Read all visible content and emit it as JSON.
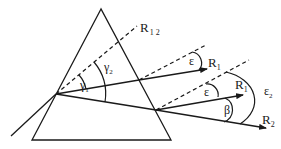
{
  "diagram": {
    "labels": {
      "r12": {
        "main": "R",
        "sub": "1 2"
      },
      "r1_upper": {
        "main": "R",
        "sub": "1"
      },
      "r1_lower": {
        "main": "R",
        "sub": "1"
      },
      "r2": {
        "main": "R",
        "sub": "2"
      },
      "gamma1": {
        "main": "γ",
        "sub": "1"
      },
      "gamma2": {
        "main": "γ",
        "sub": "2"
      },
      "epsilon_upper": {
        "main": "ε"
      },
      "epsilon_lower": {
        "main": "ε"
      },
      "epsilon2": {
        "main": "ε",
        "sub": "2"
      },
      "beta": {
        "main": "β"
      }
    },
    "colors": {
      "stroke": "#1a1a1a",
      "background": "#ffffff"
    }
  }
}
